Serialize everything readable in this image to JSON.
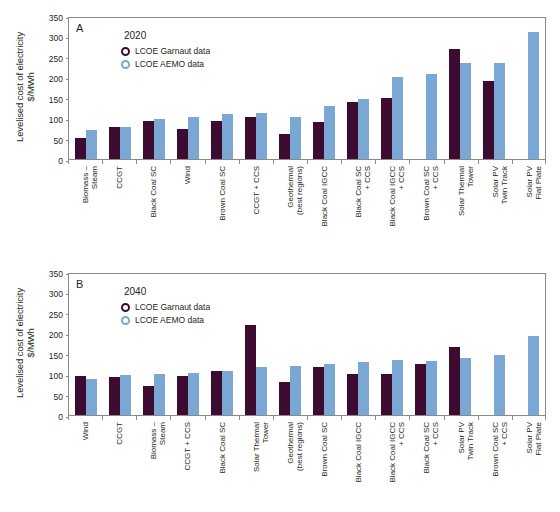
{
  "figure": {
    "ylabel": "Levelised cost of electricity\n$/MWh",
    "legend": {
      "garnaut_label": "LCOE Garnaut data",
      "aemo_label": "LCOE AEMO data",
      "garnaut_color": "#3d0a30",
      "aemo_color": "#7ba7d4",
      "marker": "open-circle"
    },
    "yticks": [
      "350",
      "300",
      "250",
      "200",
      "150",
      "100",
      "50",
      "0"
    ]
  },
  "panels": [
    {
      "id": "A",
      "letter": "A",
      "year": "2020"
    },
    {
      "id": "B",
      "letter": "B",
      "year": "2040"
    }
  ],
  "chart_data": [
    {
      "type": "bar",
      "panel": "A",
      "title": "2020",
      "xlabel": "",
      "ylabel": "Levelised cost of electricity $/MWh",
      "ylim": [
        0,
        350
      ],
      "yticks": [
        0,
        50,
        100,
        150,
        200,
        250,
        300,
        350
      ],
      "grid": false,
      "legend_position": "upper-left-inside",
      "categories": [
        "Biomass –\nSteam",
        "CCGT",
        "Black Coal SC",
        "Wind",
        "Brown Coal SC",
        "CCGT + CCS",
        "Geothermal\n(best regions)",
        "Black Coal IGCC",
        "Black Coal SC\n+ CCS",
        "Black Coal IGCC\n+ CCS",
        "Brown Coal SC\n+ CCS",
        "Solar Thermal\nTower",
        "Solar PV\nTwin Track",
        "Solar PV\nFlat Plate"
      ],
      "series": [
        {
          "name": "LCOE Garnaut data",
          "color": "#3d0a30",
          "values": [
            51,
            79,
            92,
            74,
            92,
            103,
            61,
            90,
            140,
            150,
            null,
            270,
            192,
            null
          ]
        },
        {
          "name": "LCOE AEMO data",
          "color": "#7ba7d4",
          "values": [
            70,
            78,
            98,
            102,
            110,
            112,
            104,
            130,
            146,
            200,
            208,
            236,
            236,
            312
          ]
        }
      ]
    },
    {
      "type": "bar",
      "panel": "B",
      "title": "2040",
      "xlabel": "",
      "ylabel": "Levelised cost of electricity $/MWh",
      "ylim": [
        0,
        350
      ],
      "yticks": [
        0,
        50,
        100,
        150,
        200,
        250,
        300,
        350
      ],
      "grid": false,
      "legend_position": "upper-left-inside",
      "categories": [
        "Wind",
        "CCGT",
        "Biomass –\nSteam",
        "CCGT + CCS",
        "Black Coal SC",
        "Solar Thermal\nTower",
        "Geothermal\n(best regions)",
        "Brown Coal SC",
        "Black Coal IGCC",
        "Black Coal IGCC\n+ CCS",
        "Black Coal SC\n+ CCS",
        "Solar PV\nTwin Track",
        "Brown Coal SC\n+ CCS",
        "Solar PV\nFlat Plate"
      ],
      "series": [
        {
          "name": "LCOE Garnaut data",
          "color": "#3d0a30",
          "values": [
            96,
            92,
            71,
            96,
            108,
            220,
            80,
            118,
            100,
            101,
            126,
            166,
            null,
            null
          ]
        },
        {
          "name": "LCOE AEMO data",
          "color": "#7ba7d4",
          "values": [
            87,
            98,
            100,
            102,
            108,
            117,
            121,
            124,
            130,
            134,
            131,
            140,
            146,
            194
          ]
        }
      ]
    }
  ]
}
